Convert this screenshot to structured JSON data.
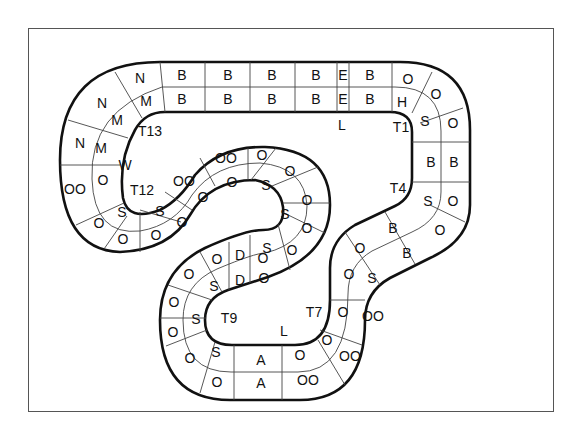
{
  "diagram": {
    "title": "",
    "type": "race-track-grid",
    "frame": {
      "border_color": "#555555"
    },
    "colors": {
      "track_edge": "#111111",
      "cell_divider": "#444444",
      "background": "#ffffff"
    },
    "corner_labels": [
      {
        "id": "T1",
        "text": "T1",
        "x": 401,
        "y": 127
      },
      {
        "id": "T4",
        "text": "T4",
        "x": 398,
        "y": 188
      },
      {
        "id": "T7",
        "text": "T7",
        "x": 314,
        "y": 312
      },
      {
        "id": "T9",
        "text": "T9",
        "x": 229,
        "y": 318
      },
      {
        "id": "T12",
        "text": "T12",
        "x": 142,
        "y": 190
      },
      {
        "id": "T13",
        "text": "T13",
        "x": 150,
        "y": 131
      },
      {
        "id": "L1",
        "text": "L",
        "x": 342,
        "y": 125
      },
      {
        "id": "L2",
        "text": "L",
        "x": 284,
        "y": 331
      },
      {
        "id": "W",
        "text": "W",
        "x": 125,
        "y": 165
      }
    ],
    "cells": [
      {
        "text": "N",
        "x": 140,
        "y": 78
      },
      {
        "text": "B",
        "x": 182,
        "y": 75
      },
      {
        "text": "B",
        "x": 228,
        "y": 75
      },
      {
        "text": "B",
        "x": 272,
        "y": 75
      },
      {
        "text": "B",
        "x": 316,
        "y": 75
      },
      {
        "text": "E",
        "x": 343,
        "y": 75
      },
      {
        "text": "B",
        "x": 370,
        "y": 75
      },
      {
        "text": "O",
        "x": 408,
        "y": 79
      },
      {
        "text": "O",
        "x": 436,
        "y": 94
      },
      {
        "text": "O",
        "x": 453,
        "y": 123
      },
      {
        "text": "B",
        "x": 454,
        "y": 162
      },
      {
        "text": "O",
        "x": 453,
        "y": 201
      },
      {
        "text": "O",
        "x": 440,
        "y": 230
      },
      {
        "text": "B",
        "x": 407,
        "y": 253
      },
      {
        "text": "S",
        "x": 372,
        "y": 278
      },
      {
        "text": "O",
        "x": 343,
        "y": 312
      },
      {
        "text": "OO",
        "x": 373,
        "y": 316
      },
      {
        "text": "OO",
        "x": 350,
        "y": 356
      },
      {
        "text": "OO",
        "x": 308,
        "y": 380
      },
      {
        "text": "A",
        "x": 261,
        "y": 383
      },
      {
        "text": "O",
        "x": 217,
        "y": 382
      },
      {
        "text": "O",
        "x": 190,
        "y": 358
      },
      {
        "text": "O",
        "x": 173,
        "y": 332
      },
      {
        "text": "O",
        "x": 174,
        "y": 302
      },
      {
        "text": "O",
        "x": 189,
        "y": 274
      },
      {
        "text": "O",
        "x": 217,
        "y": 259
      },
      {
        "text": "O",
        "x": 263,
        "y": 258
      },
      {
        "text": "O",
        "x": 292,
        "y": 250
      },
      {
        "text": "O",
        "x": 307,
        "y": 228
      },
      {
        "text": "O",
        "x": 307,
        "y": 200
      },
      {
        "text": "O",
        "x": 290,
        "y": 171
      },
      {
        "text": "O",
        "x": 262,
        "y": 155
      },
      {
        "text": "OO",
        "x": 226,
        "y": 158
      },
      {
        "text": "OO",
        "x": 184,
        "y": 181
      },
      {
        "text": "O",
        "x": 182,
        "y": 222
      },
      {
        "text": "O",
        "x": 156,
        "y": 235
      },
      {
        "text": "O",
        "x": 123,
        "y": 239
      },
      {
        "text": "O",
        "x": 99,
        "y": 223
      },
      {
        "text": "OO",
        "x": 75,
        "y": 189
      },
      {
        "text": "N",
        "x": 80,
        "y": 143
      },
      {
        "text": "N",
        "x": 102,
        "y": 103
      },
      {
        "text": "M",
        "x": 146,
        "y": 101
      },
      {
        "text": "B",
        "x": 182,
        "y": 99
      },
      {
        "text": "B",
        "x": 228,
        "y": 99
      },
      {
        "text": "B",
        "x": 272,
        "y": 99
      },
      {
        "text": "B",
        "x": 316,
        "y": 99
      },
      {
        "text": "E",
        "x": 343,
        "y": 99
      },
      {
        "text": "B",
        "x": 370,
        "y": 99
      },
      {
        "text": "H",
        "x": 402,
        "y": 102
      },
      {
        "text": "S",
        "x": 425,
        "y": 121
      },
      {
        "text": "B",
        "x": 431,
        "y": 162
      },
      {
        "text": "S",
        "x": 428,
        "y": 201
      },
      {
        "text": "B",
        "x": 393,
        "y": 228
      },
      {
        "text": "O",
        "x": 360,
        "y": 248
      },
      {
        "text": "O",
        "x": 349,
        "y": 274
      },
      {
        "text": "O",
        "x": 327,
        "y": 340
      },
      {
        "text": "O",
        "x": 300,
        "y": 355
      },
      {
        "text": "A",
        "x": 261,
        "y": 360
      },
      {
        "text": "S",
        "x": 216,
        "y": 352
      },
      {
        "text": "S",
        "x": 196,
        "y": 319
      },
      {
        "text": "S",
        "x": 214,
        "y": 286
      },
      {
        "text": "D",
        "x": 240,
        "y": 255
      },
      {
        "text": "D",
        "x": 240,
        "y": 280
      },
      {
        "text": "O",
        "x": 264,
        "y": 278
      },
      {
        "text": "S",
        "x": 267,
        "y": 248
      },
      {
        "text": "S",
        "x": 285,
        "y": 214
      },
      {
        "text": "S",
        "x": 266,
        "y": 185
      },
      {
        "text": "O",
        "x": 232,
        "y": 182
      },
      {
        "text": "O",
        "x": 203,
        "y": 197
      },
      {
        "text": "S",
        "x": 160,
        "y": 211
      },
      {
        "text": "S",
        "x": 122,
        "y": 212
      },
      {
        "text": "O",
        "x": 103,
        "y": 180
      },
      {
        "text": "M",
        "x": 101,
        "y": 148
      },
      {
        "text": "M",
        "x": 117,
        "y": 120
      }
    ]
  }
}
